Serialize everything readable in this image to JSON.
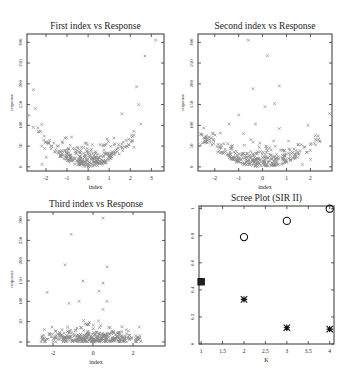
{
  "chart_data": [
    {
      "type": "scatter",
      "title": "First index vs Response",
      "xlabel": "index",
      "ylabel": "response",
      "xlim": [
        -2.9,
        3.6
      ],
      "ylim": [
        -10,
        320
      ],
      "xticks": [
        -2,
        -1,
        0,
        1,
        2,
        3
      ],
      "yticks": [
        0,
        50,
        100,
        150,
        200,
        250,
        300
      ],
      "marker": "x",
      "color": "#8a8a8a",
      "shape": "u-shaped (quadratic) response in index",
      "outliers": [
        [
          3.2,
          305
        ],
        [
          2.7,
          267
        ],
        [
          2.3,
          193
        ],
        [
          2.4,
          150
        ],
        [
          2.5,
          103
        ],
        [
          1.6,
          128
        ],
        [
          -2.6,
          186
        ],
        [
          -2.5,
          140
        ],
        [
          -2.8,
          124
        ],
        [
          -2.6,
          95
        ],
        [
          -2.2,
          102
        ]
      ],
      "cloud": {
        "x_range": [
          -2.4,
          2.2
        ],
        "y_range": [
          0,
          70
        ],
        "n": 300,
        "curvature": 14
      }
    },
    {
      "type": "scatter",
      "title": "Second index vs Response",
      "xlabel": "index",
      "ylabel": "response",
      "xlim": [
        -2.7,
        2.9
      ],
      "ylim": [
        -10,
        320
      ],
      "xticks": [
        -2,
        -1,
        0,
        1,
        2
      ],
      "yticks": [
        0,
        50,
        100,
        150,
        200,
        250,
        300
      ],
      "marker": "x",
      "color": "#8a8a8a",
      "shape": "u-shaped (quadratic) response in index",
      "outliers": [
        [
          -0.6,
          305
        ],
        [
          0.2,
          268
        ],
        [
          -0.4,
          188
        ],
        [
          0.7,
          195
        ],
        [
          0.1,
          145
        ],
        [
          0.5,
          152
        ],
        [
          -1.0,
          125
        ],
        [
          -1.4,
          103
        ],
        [
          -0.3,
          103
        ],
        [
          0.7,
          92
        ],
        [
          2.8,
          128
        ],
        [
          1.9,
          100
        ],
        [
          -0.8,
          80
        ]
      ],
      "cloud": {
        "x_range": [
          -2.6,
          2.4
        ],
        "y_range": [
          0,
          70
        ],
        "n": 320,
        "curvature": 10
      }
    },
    {
      "type": "scatter",
      "title": "Third index vs Response",
      "xlabel": "index",
      "ylabel": "response",
      "xlim": [
        -3.3,
        3.6
      ],
      "ylim": [
        -10,
        320
      ],
      "xticks": [
        -2,
        0,
        2
      ],
      "yticks": [
        0,
        50,
        100,
        150,
        200,
        250,
        300
      ],
      "marker": "x",
      "color": "#8a8a8a",
      "shape": "no clear structure; cloud centered at 0",
      "outliers": [
        [
          0.5,
          305
        ],
        [
          -1.1,
          265
        ],
        [
          -1.4,
          190
        ],
        [
          0.7,
          185
        ],
        [
          -0.5,
          150
        ],
        [
          0.5,
          145
        ],
        [
          0.3,
          125
        ],
        [
          -2.3,
          122
        ],
        [
          -1.2,
          95
        ],
        [
          -0.7,
          100
        ],
        [
          0.7,
          100
        ],
        [
          0.5,
          80
        ]
      ],
      "cloud": {
        "x_range": [
          -2.6,
          2.4
        ],
        "y_range": [
          0,
          55
        ],
        "n": 360,
        "curvature": 0
      }
    },
    {
      "type": "scatter",
      "title": "Scree Plot (SIR II)",
      "xlabel": "K",
      "ylabel": "",
      "xlim": [
        0.95,
        4.1
      ],
      "ylim": [
        0,
        1.02
      ],
      "xticks": [
        1,
        1.5,
        2,
        2.5,
        3,
        3.5,
        4
      ],
      "yticks": [
        0,
        0.2,
        0.4,
        0.6,
        0.8,
        1
      ],
      "series": [
        {
          "name": "cumulative",
          "marker": "open-circle",
          "x": [
            1,
            2,
            3,
            4
          ],
          "y": [
            0.46,
            0.79,
            0.91,
            1.0
          ]
        },
        {
          "name": "eigenvalue",
          "marker": "filled-square-star",
          "x": [
            1,
            2,
            3,
            4
          ],
          "y": [
            0.46,
            0.33,
            0.12,
            0.11
          ]
        }
      ]
    }
  ]
}
